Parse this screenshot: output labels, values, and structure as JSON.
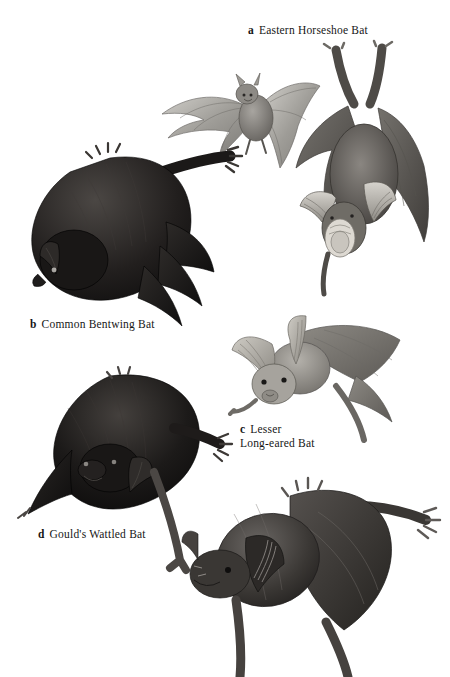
{
  "page": {
    "background_color": "#ffffff",
    "width": 450,
    "height": 677,
    "kind": "illustration-plate"
  },
  "figures": [
    {
      "key": "a",
      "title": "Eastern Horseshoe Bat",
      "caption_lines": [
        "Eastern Horseshoe Bat"
      ],
      "subject": "horseshoe-bat",
      "depiction": "one bat in flight with outspread wings and a second bat hanging upside down from a branch",
      "tone": "medium-grey",
      "colors": {
        "body": "#8e8e8e",
        "wing": "#a9a9a9",
        "shadow": "#5d5d5d",
        "highlight": "#d7d6d2"
      }
    },
    {
      "key": "b",
      "title": "Common Bentwing Bat",
      "caption_lines": [
        "Common Bentwing Bat"
      ],
      "subject": "bentwing-bat",
      "depiction": "dark bat hanging head-down with folded wings and long forearm extended",
      "tone": "very-dark",
      "colors": {
        "body": "#1d1b1a",
        "wing": "#2b2927",
        "shadow": "#0c0b0b",
        "highlight": "#5a5653"
      }
    },
    {
      "key": "c",
      "title": "Lesser Long-eared Bat",
      "caption_lines": [
        "Lesser",
        "Long-eared Bat"
      ],
      "subject": "long-eared-bat",
      "depiction": "pale grey bat with very large ridged ears clinging head-down",
      "tone": "light-grey",
      "colors": {
        "body": "#9a9893",
        "wing": "#8b8985",
        "shadow": "#63605c",
        "highlight": "#cfccc6"
      }
    },
    {
      "key": "d",
      "title": "Gould's Wattled Bat",
      "caption_lines": [
        "Gould's Wattled Bat"
      ],
      "subject": "wattled-bat",
      "depiction": "rounded black furry bat hanging with wings wrapped and thumb claws gripping",
      "tone": "near-black",
      "colors": {
        "body": "#161514",
        "wing": "#232120",
        "shadow": "#080808",
        "highlight": "#4c4845"
      }
    },
    {
      "key": "",
      "title": "",
      "caption_lines": [],
      "subject": "free-tailed-bat",
      "depiction": "unlabelled dark grey bat at lower right, head down, legs cropped by page edge",
      "tone": "dark-grey",
      "colors": {
        "body": "#3c3a38",
        "wing": "#4a4745",
        "shadow": "#1d1c1b",
        "highlight": "#777370"
      }
    }
  ]
}
